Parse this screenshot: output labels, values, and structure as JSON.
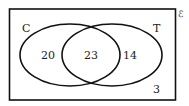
{
  "diagram": {
    "type": "venn",
    "universal_symbol": "ℰ",
    "sets": [
      {
        "name": "C",
        "label": "C",
        "only": "20"
      },
      {
        "name": "T",
        "label": "T",
        "only": "14"
      }
    ],
    "intersection": "23",
    "outside": "3",
    "colors": {
      "stroke": "#111111",
      "background": "#ffffff"
    }
  }
}
